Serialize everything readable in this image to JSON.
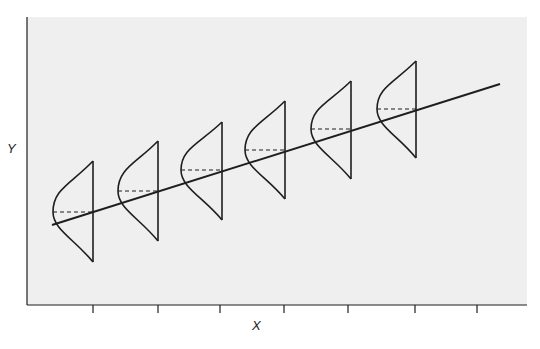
{
  "figure": {
    "type": "regression-diagram",
    "x_axis_label": "X",
    "y_axis_label": "Y",
    "colors": {
      "background": "#ffffff",
      "plot_area": "#efefef",
      "stroke": "#1e1e1e"
    },
    "plot_area": {
      "left": 27,
      "top": 17,
      "right": 527,
      "bottom": 305
    },
    "x_ticks": [
      93,
      158,
      220,
      284,
      348,
      415,
      477
    ],
    "regression_line": {
      "x1": 52,
      "y1": 225,
      "x2": 500,
      "y2": 84
    },
    "distributions": [
      {
        "x": 93,
        "top": 161,
        "bottom": 262,
        "mean": 212,
        "bulge": 53
      },
      {
        "x": 158,
        "top": 141,
        "bottom": 241,
        "mean": 191,
        "bulge": 118
      },
      {
        "x": 222,
        "top": 122,
        "bottom": 220,
        "mean": 170,
        "bulge": 181
      },
      {
        "x": 285,
        "top": 101,
        "bottom": 199,
        "mean": 150,
        "bulge": 245
      },
      {
        "x": 351,
        "top": 81,
        "bottom": 179,
        "mean": 129,
        "bulge": 311
      },
      {
        "x": 416,
        "top": 61,
        "bottom": 158,
        "mean": 109,
        "bulge": 377
      }
    ]
  }
}
